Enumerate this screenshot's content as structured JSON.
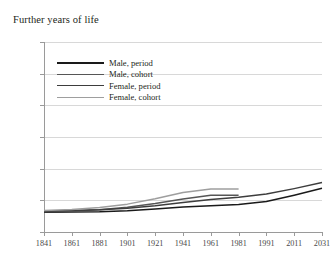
{
  "chart_data": {
    "type": "line",
    "title": "Further years of life",
    "xlabel": "",
    "ylabel": "",
    "ylim": [
      0,
      60
    ],
    "yticks": [
      0,
      10,
      20,
      30,
      40,
      50,
      60
    ],
    "xticks": [
      "1841",
      "1861",
      "1881",
      "1901",
      "1921",
      "1941",
      "1961",
      "1981",
      "1991",
      "2011",
      "2031"
    ],
    "grid": true,
    "legend_position": "upper-left-inside",
    "series": [
      {
        "name": "Male, period",
        "color": "#1a1a1a",
        "x": [
          "1841",
          "1861",
          "1881",
          "1901",
          "1921",
          "1941",
          "1961",
          "1981",
          "1991",
          "2011",
          "2031"
        ],
        "values": [
          6.2,
          6.3,
          6.4,
          6.7,
          7.3,
          7.9,
          8.3,
          8.7,
          9.6,
          11.6,
          13.8
        ]
      },
      {
        "name": "Male, cohort",
        "color": "#565656",
        "x": [
          "1841",
          "1861",
          "1881",
          "1901",
          "1921",
          "1941",
          "1961",
          "1981"
        ],
        "values": [
          6.4,
          6.6,
          7.0,
          7.8,
          9.0,
          10.4,
          11.6,
          11.6
        ]
      },
      {
        "name": "Female, period",
        "color": "#3d3d3d",
        "x": [
          "1841",
          "1861",
          "1881",
          "1901",
          "1921",
          "1941",
          "1961",
          "1981",
          "1991",
          "2011",
          "2031"
        ],
        "values": [
          6.6,
          6.8,
          7.0,
          7.5,
          8.3,
          9.3,
          10.3,
          11.0,
          12.0,
          13.7,
          15.6
        ]
      },
      {
        "name": "Female, cohort",
        "color": "#9e9e9e",
        "x": [
          "1841",
          "1861",
          "1881",
          "1901",
          "1921",
          "1941",
          "1961",
          "1981"
        ],
        "values": [
          6.8,
          7.1,
          7.7,
          8.8,
          10.5,
          12.5,
          13.6,
          13.6
        ]
      }
    ]
  },
  "legend": {
    "items": [
      {
        "label": "Male, period"
      },
      {
        "label": "Male, cohort"
      },
      {
        "label": "Female, period"
      },
      {
        "label": "Female, cohort"
      }
    ]
  }
}
